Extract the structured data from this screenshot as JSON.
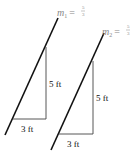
{
  "diagram": {
    "left": {
      "slope_symbol": "m",
      "slope_subscript": "1",
      "slope_eq": "=",
      "slope_num": "5",
      "slope_den": "3",
      "rise_label": "5 ft",
      "run_label": "3 ft"
    },
    "right": {
      "slope_symbol": "m",
      "slope_subscript": "2",
      "slope_eq": "=",
      "slope_num": "5",
      "slope_den": "3",
      "rise_label": "5 ft",
      "run_label": "3 ft"
    },
    "colors": {
      "line": "#111111",
      "triangle": "#444444",
      "slope_label": "#888888"
    }
  }
}
